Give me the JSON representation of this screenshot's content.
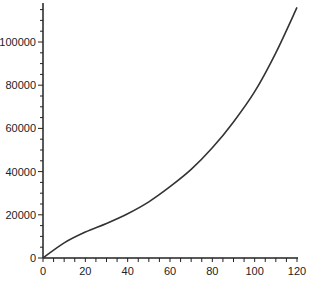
{
  "chart_data": {
    "type": "line",
    "title": "",
    "xlabel": "",
    "ylabel": "",
    "xlim": [
      0,
      120
    ],
    "ylim": [
      0,
      117000
    ],
    "grid": false,
    "legend": null,
    "x_ticks": [
      0,
      20,
      40,
      60,
      80,
      100,
      120
    ],
    "y_ticks": [
      0,
      20000,
      40000,
      60000,
      80000,
      100000
    ],
    "series": [
      {
        "name": "series-1",
        "color": "#333333",
        "x": [
          0,
          10,
          20,
          30,
          40,
          50,
          60,
          70,
          80,
          90,
          100,
          110,
          120
        ],
        "y": [
          0,
          7000,
          12000,
          16000,
          20500,
          26000,
          33000,
          41000,
          51000,
          63000,
          77000,
          95000,
          116000
        ]
      }
    ]
  },
  "labels": {
    "x": [
      "0",
      "20",
      "40",
      "60",
      "80",
      "100",
      "120"
    ],
    "y": [
      "0",
      "20000",
      "40000",
      "60000",
      "80000",
      "100000"
    ]
  }
}
